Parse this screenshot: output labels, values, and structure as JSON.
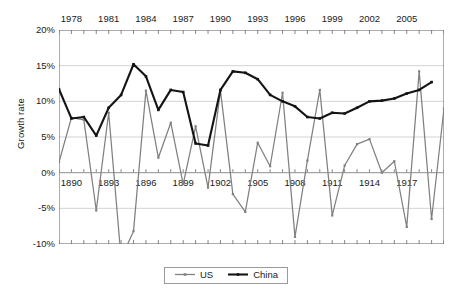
{
  "chart_data": {
    "type": "line",
    "title": "",
    "xlabel": "",
    "ylabel": "Growth rate",
    "ylim": [
      -10,
      20
    ],
    "ytick_labels": [
      "20%",
      "15%",
      "10%",
      "5%",
      "0%",
      "-5%",
      "-10%"
    ],
    "ytick_values": [
      20,
      15,
      10,
      5,
      0,
      -5,
      -10
    ],
    "grid": true,
    "legend_position": "bottom-center",
    "x_top_axis_label": "China years",
    "x_bottom_axis_label": "US years",
    "x_top_ticks": [
      "1978",
      "1981",
      "1984",
      "1987",
      "1990",
      "1993",
      "1996",
      "1999",
      "2002",
      "2005"
    ],
    "x_bottom_ticks": [
      "1890",
      "1893",
      "1896",
      "1899",
      "1902",
      "1905",
      "1908",
      "1911",
      "1914",
      "1917"
    ],
    "x_top_start": 1977,
    "x_bottom_start": 1889,
    "n_points": 32,
    "series": [
      {
        "name": "US",
        "color": "#808080",
        "values": [
          1.5,
          7.7,
          7.4,
          -5.3,
          8.4,
          -12.0,
          -8.2,
          11.5,
          2.1,
          7.0,
          -1.6,
          6.5,
          -2.1,
          11.5,
          -3.0,
          -5.5,
          4.2,
          0.9,
          11.2,
          -9.0,
          1.7,
          11.6,
          -6.0,
          1.0,
          4.0,
          4.7,
          0.0,
          1.6,
          -7.6,
          14.2,
          -6.5,
          9.0,
          1.4
        ]
      },
      {
        "name": "China",
        "color": "#141414",
        "values": [
          11.7,
          7.6,
          7.8,
          5.2,
          9.1,
          10.9,
          15.2,
          13.5,
          8.8,
          11.6,
          11.3,
          4.1,
          3.8,
          11.6,
          14.2,
          14.0,
          13.1,
          10.9,
          10.0,
          9.3,
          7.8,
          7.6,
          8.4,
          8.3,
          9.1,
          10.0,
          10.1,
          10.4,
          11.1,
          11.6,
          12.7
        ]
      }
    ]
  },
  "legend": {
    "items": [
      {
        "label": "US",
        "color": "#808080"
      },
      {
        "label": "China",
        "color": "#141414"
      }
    ]
  }
}
